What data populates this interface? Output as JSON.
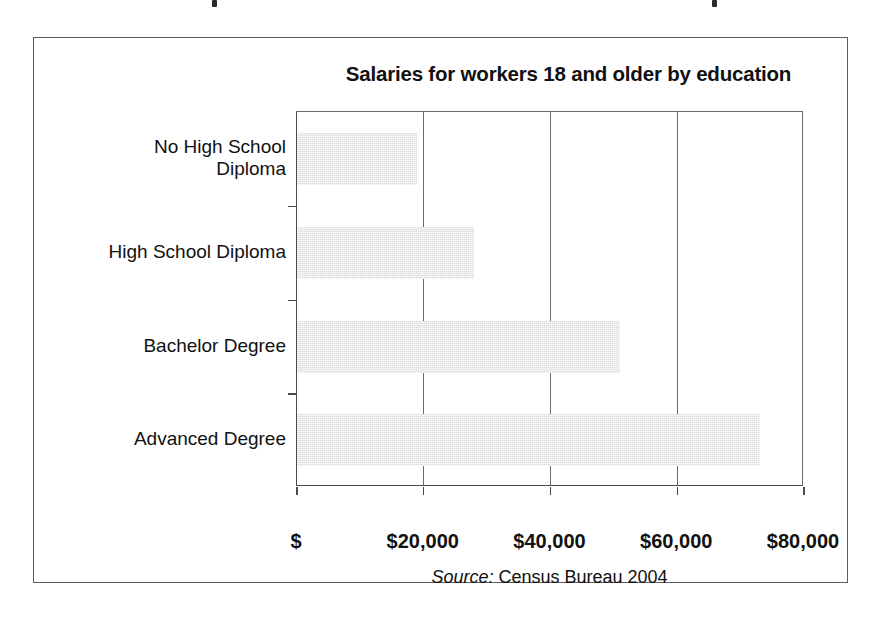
{
  "figure": {
    "title": "Salaries for workers 18 and older by education",
    "source_label": "Source:",
    "source_text": "Census Bureau 2004"
  },
  "chart_data": {
    "type": "bar",
    "orientation": "horizontal",
    "title": "Salaries for workers 18 and older by education",
    "categories": [
      "No High School Diploma",
      "High School Diploma",
      "Bachelor Degree",
      "Advanced Degree"
    ],
    "values": [
      19000,
      28000,
      51000,
      73000
    ],
    "xlabel": "",
    "ylabel": "",
    "xlim": [
      0,
      80000
    ],
    "xticks": [
      0,
      20000,
      40000,
      60000,
      80000
    ],
    "xticklabels": [
      "$",
      "$20,000",
      "$40,000",
      "$60,000",
      "$80,000"
    ],
    "grid": "vertical",
    "legend": "none",
    "bar_color": "#dedede",
    "axis_color": "#4a4a4a",
    "source": "Source: Census Bureau 2004"
  },
  "category_lines": [
    [
      "No High School",
      "Diploma"
    ],
    [
      "High School Diploma"
    ],
    [
      "Bachelor Degree"
    ],
    [
      "Advanced Degree"
    ]
  ]
}
